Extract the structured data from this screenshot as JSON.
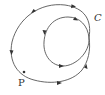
{
  "diagram": {
    "title": "",
    "curve_label": "C",
    "point_label": "P",
    "colors": {
      "stroke": "#555555",
      "arrow": "#333333",
      "background": "#ffffff"
    }
  }
}
